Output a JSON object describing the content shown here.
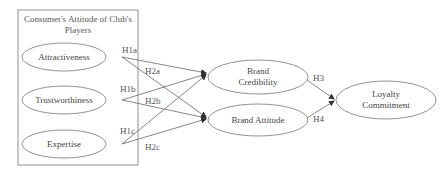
{
  "diagram": {
    "group": {
      "title_line1": "Consumer's Attitude of Club's",
      "title_line2": "Players"
    },
    "nodes": {
      "attractiveness": "Attractiveness",
      "trustworthiness": "Trustworthiness",
      "expertise": "Expertise",
      "brand_credibility_line1": "Brand",
      "brand_credibility_line2": "Credibility",
      "brand_attitude": "Brand Attitude",
      "loyalty_line1": "Loyalty",
      "loyalty_line2": "Commitment"
    },
    "hypotheses": {
      "h1a": "H1a",
      "h1b": "H1b",
      "h1c": "H1c",
      "h2a": "H2a",
      "h2b": "H2b",
      "h2c": "H2c",
      "h3": "H3",
      "h4": "H4"
    },
    "colors": {
      "stroke": "#777777",
      "text": "#444444"
    }
  }
}
